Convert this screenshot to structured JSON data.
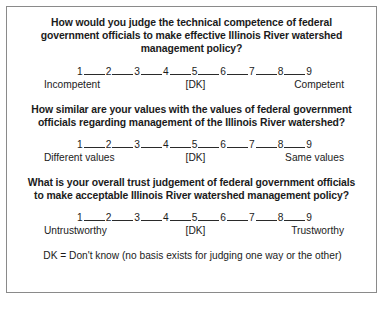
{
  "card": {
    "questions": [
      {
        "heading": "How would you judge the technical competence of federal government officials to make effective Illinois River watershed management policy?",
        "scale_points": [
          "1",
          "2",
          "3",
          "4",
          "5",
          "6",
          "7",
          "8",
          "9"
        ],
        "anchor_left": "Incompetent",
        "anchor_mid": "[DK]",
        "anchor_right": "Competent"
      },
      {
        "heading": "How similar are your values with the values of federal government officials regarding management of the Illinois River watershed?",
        "scale_points": [
          "1",
          "2",
          "3",
          "4",
          "5",
          "6",
          "7",
          "8",
          "9"
        ],
        "anchor_left": "Different values",
        "anchor_mid": "[DK]",
        "anchor_right": "Same values"
      },
      {
        "heading": "What is your overall trust judgement of federal government officials to make acceptable Illinois River watershed management policy?",
        "scale_points": [
          "1",
          "2",
          "3",
          "4",
          "5",
          "6",
          "7",
          "8",
          "9"
        ],
        "anchor_left": "Untrustworthy",
        "anchor_mid": "[DK]",
        "anchor_right": "Trustworthy"
      }
    ],
    "footnote": "DK = Don't know (no basis exists for judging one way or the other)"
  }
}
